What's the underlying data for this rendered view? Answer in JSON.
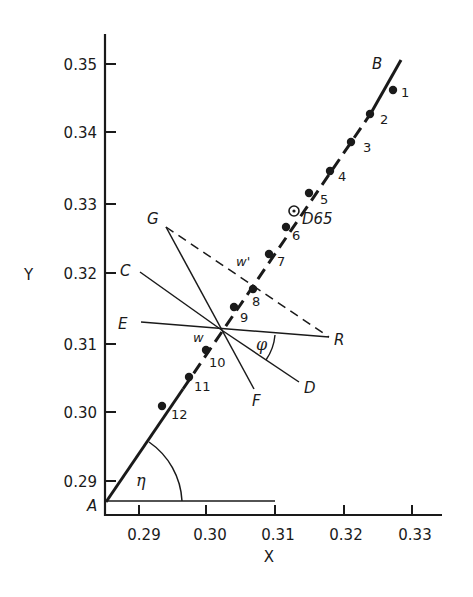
{
  "figure": {
    "type": "chromaticity diagram detail",
    "axes": {
      "x_title": "X",
      "y_title": "Y",
      "x_ticks": [
        "0.29",
        "0.30",
        "0.31",
        "0.32",
        "0.33"
      ],
      "y_ticks": [
        "0.35",
        "0.34",
        "0.33",
        "0.32",
        "0.31",
        "0.30",
        "0.29"
      ]
    },
    "locus_line": {
      "start_label": "A",
      "end_label": "B"
    },
    "points": [
      {
        "label": "1"
      },
      {
        "label": "2"
      },
      {
        "label": "3"
      },
      {
        "label": "4"
      },
      {
        "label": "5"
      },
      {
        "label": "6"
      },
      {
        "label": "7"
      },
      {
        "label": "8"
      },
      {
        "label": "9"
      },
      {
        "label": "10"
      },
      {
        "label": "11"
      },
      {
        "label": "12"
      }
    ],
    "reference_point": {
      "label": "D65"
    },
    "construction": {
      "labels": {
        "G": "G",
        "C": "C",
        "E": "E",
        "R": "R",
        "D": "D",
        "F": "F",
        "w": "w",
        "w_prime": "w'"
      },
      "angles": {
        "phi": "φ",
        "eta": "η"
      }
    }
  }
}
